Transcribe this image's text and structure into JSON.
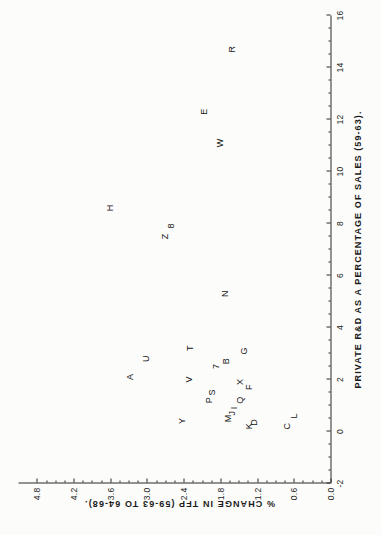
{
  "chart_data": {
    "type": "scatter",
    "title": "",
    "xlabel": "PRIVATE R&D AS A PERCENTAGE OF SALES (59-63).",
    "ylabel": "% CHANGE IN TFP (59-63 TO 64-68).",
    "xlim": [
      -2,
      16
    ],
    "ylim": [
      0.0,
      5.1
    ],
    "xticks": [
      "-2",
      "0",
      "2",
      "4",
      "6",
      "8",
      "10",
      "12",
      "14",
      "16"
    ],
    "xtick_values": [
      -2,
      0,
      2,
      4,
      6,
      8,
      10,
      12,
      14,
      16
    ],
    "yticks": [
      "0.0",
      "0.6",
      "1.2",
      "1.8",
      "2.4",
      "3.0",
      "3.6",
      "4.2",
      "4.8"
    ],
    "ytick_values": [
      0.0,
      0.6,
      1.2,
      1.8,
      2.4,
      3.0,
      3.6,
      4.2,
      4.8
    ],
    "grid": false,
    "legend": "none",
    "point_style": "letter-label",
    "points": [
      {
        "label": "R",
        "x": 14.7,
        "y": 1.62
      },
      {
        "label": "E",
        "x": 12.3,
        "y": 2.08
      },
      {
        "label": "W",
        "x": 11.1,
        "y": 1.82
      },
      {
        "label": "H",
        "x": 8.6,
        "y": 3.62
      },
      {
        "label": "Z",
        "x": 7.5,
        "y": 2.72
      },
      {
        "label": "8",
        "x": 7.9,
        "y": 2.62
      },
      {
        "label": "N",
        "x": 5.3,
        "y": 1.74
      },
      {
        "label": "T",
        "x": 3.2,
        "y": 2.3
      },
      {
        "label": "U",
        "x": 2.8,
        "y": 3.02
      },
      {
        "label": "G",
        "x": 3.1,
        "y": 1.42
      },
      {
        "label": "A",
        "x": 2.1,
        "y": 3.28
      },
      {
        "label": "V",
        "x": 2.0,
        "y": 2.32
      },
      {
        "label": "7",
        "x": 2.5,
        "y": 1.88
      },
      {
        "label": "B",
        "x": 2.7,
        "y": 1.72
      },
      {
        "label": "X",
        "x": 1.9,
        "y": 1.48
      },
      {
        "label": "F",
        "x": 1.7,
        "y": 1.34
      },
      {
        "label": "S",
        "x": 1.5,
        "y": 1.94
      },
      {
        "label": "P",
        "x": 1.2,
        "y": 2.0
      },
      {
        "label": "Q",
        "x": 1.2,
        "y": 1.48
      },
      {
        "label": "I",
        "x": 0.9,
        "y": 1.58
      },
      {
        "label": "J",
        "x": 0.7,
        "y": 1.62
      },
      {
        "label": "M",
        "x": 0.5,
        "y": 1.68
      },
      {
        "label": "Y",
        "x": 0.4,
        "y": 2.44
      },
      {
        "label": "K",
        "x": 0.2,
        "y": 1.34
      },
      {
        "label": "D",
        "x": 0.35,
        "y": 1.26
      },
      {
        "label": "C",
        "x": 0.2,
        "y": 0.72
      },
      {
        "label": "L",
        "x": 0.6,
        "y": 0.6
      }
    ]
  }
}
